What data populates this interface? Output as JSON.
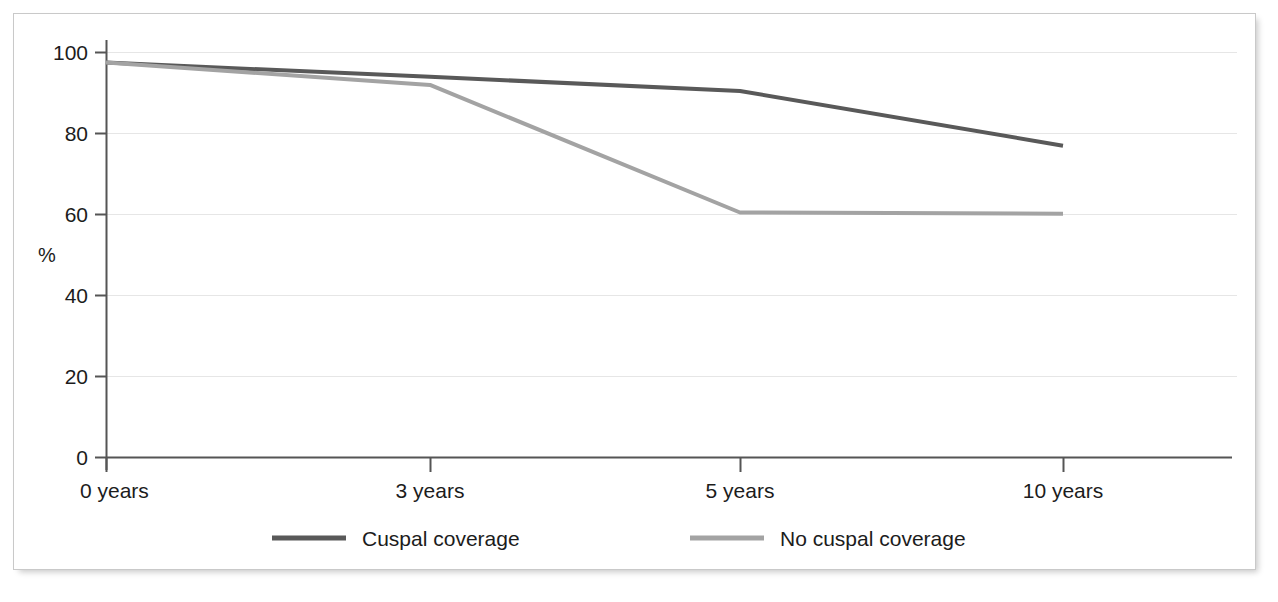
{
  "chart_data": {
    "type": "line",
    "title": "",
    "subtitle": "",
    "xlabel": "",
    "ylabel": "%",
    "categories": [
      "0 years",
      "3 years",
      "5 years",
      "10 years"
    ],
    "x": [
      0,
      3,
      5,
      10
    ],
    "xlim": [
      0,
      10
    ],
    "ylim": [
      0,
      100
    ],
    "yticks": [
      0,
      20,
      40,
      60,
      80,
      100
    ],
    "ytick_labels": [
      "0",
      "20",
      "40",
      "60",
      "80",
      "100"
    ],
    "xtick_labels": [
      "0 years",
      "3 years",
      "5 years",
      "10 years"
    ],
    "grid": true,
    "grid_axis": "y",
    "legend_position": "bottom",
    "series": [
      {
        "name": "Cuspal coverage",
        "color": "#595959",
        "values": [
          97.5,
          94.0,
          90.5,
          77.0
        ]
      },
      {
        "name": "No cuspal coverage",
        "color": "#a3a3a3",
        "values": [
          97.5,
          92.0,
          60.5,
          60.2
        ]
      }
    ],
    "annotations": []
  },
  "axes": {
    "y_axis_title": "%",
    "y_ticks": [
      {
        "value": 100,
        "label": "100"
      },
      {
        "value": 80,
        "label": "80"
      },
      {
        "value": 60,
        "label": "60"
      },
      {
        "value": 40,
        "label": "40"
      },
      {
        "value": 20,
        "label": "20"
      },
      {
        "value": 0,
        "label": "0"
      }
    ],
    "x_ticks": [
      {
        "value": 0,
        "label": "0 years"
      },
      {
        "value": 3,
        "label": "3 years"
      },
      {
        "value": 5,
        "label": "5 years"
      },
      {
        "value": 10,
        "label": "10 years"
      }
    ]
  },
  "legend": {
    "items": [
      {
        "label": "Cuspal coverage",
        "color": "#595959"
      },
      {
        "label": "No cuspal coverage",
        "color": "#a3a3a3"
      }
    ]
  },
  "colors": {
    "series_1": "#595959",
    "series_2": "#a3a3a3",
    "axis": "#4a4a4a",
    "grid": "#e6e6e6",
    "frame_border": "#c9c9c9",
    "text": "#1c1c1c",
    "background": "#ffffff"
  }
}
